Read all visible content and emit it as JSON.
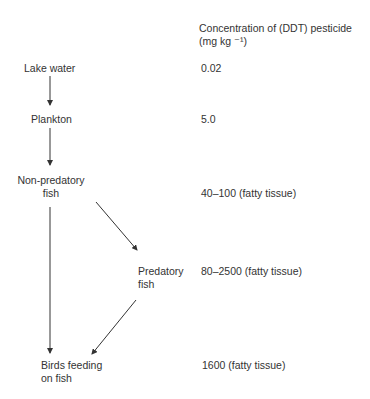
{
  "header": {
    "line1": "Concentration of (DDT) pesticide",
    "line2": "(mg kg ⁻¹)"
  },
  "nodes": [
    {
      "id": "lake",
      "label1": "Lake water",
      "label2": "",
      "value": "0.02"
    },
    {
      "id": "plankton",
      "label1": "Plankton",
      "label2": "",
      "value": "5.0"
    },
    {
      "id": "nonpred",
      "label1": "Non-predatory",
      "label2": "fish",
      "value": "40–100 (fatty tissue)"
    },
    {
      "id": "pred",
      "label1": "Predatory",
      "label2": "fish",
      "value": "80–2500 (fatty tissue)"
    },
    {
      "id": "birds",
      "label1": "Birds feeding",
      "label2": "on fish",
      "value": "1600 (fatty tissue)"
    }
  ],
  "colors": {
    "text": "#333333",
    "arrow": "#333333"
  }
}
